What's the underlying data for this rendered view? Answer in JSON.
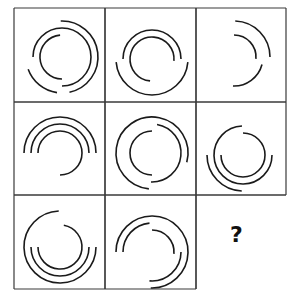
{
  "puzzle": {
    "type": "matrix-reasoning",
    "rows": 3,
    "cols": 3,
    "grid_x": [
      14,
      105,
      196,
      286
    ],
    "grid_y": [
      8,
      102,
      195,
      289
    ],
    "line_color": "#3a3a3a",
    "stroke_color": "#1a1a1a",
    "missing_cell": {
      "row": 2,
      "col": 2,
      "label": "?"
    },
    "cells": [
      {
        "row": 0,
        "col": 0,
        "center": [
          48,
          49
        ],
        "arcs": [
          {
            "r": 22,
            "start": 90,
            "end": 265
          },
          {
            "r": 29,
            "start": 180,
            "end": 450
          },
          {
            "r": 36,
            "start": -92,
            "end": 78
          },
          {
            "r": 36,
            "start": 98,
            "end": 160
          }
        ]
      },
      {
        "row": 0,
        "col": 1,
        "center": [
          47,
          51
        ],
        "arcs": [
          {
            "r": 22,
            "start": 95,
            "end": 365
          },
          {
            "r": 29,
            "start": 180,
            "end": 360
          },
          {
            "r": 36,
            "start": 5,
            "end": 175
          }
        ]
      },
      {
        "row": 0,
        "col": 2,
        "center": [
          38,
          49
        ],
        "arcs": [
          {
            "r": 22,
            "start": -90,
            "end": 5
          },
          {
            "r": 29,
            "start": 15,
            "end": 92
          },
          {
            "r": 36,
            "start": -88,
            "end": 0
          }
        ]
      },
      {
        "row": 1,
        "col": 0,
        "center": [
          46,
          51
        ],
        "arcs": [
          {
            "r": 22,
            "start": 180,
            "end": 450
          },
          {
            "r": 29,
            "start": 180,
            "end": 360
          },
          {
            "r": 36,
            "start": 180,
            "end": 360
          }
        ]
      },
      {
        "row": 1,
        "col": 1,
        "center": [
          47,
          51
        ],
        "arcs": [
          {
            "r": 22,
            "start": 90,
            "end": 270
          },
          {
            "r": 29,
            "start": -80,
            "end": 92
          },
          {
            "r": 36,
            "start": 95,
            "end": 375
          }
        ]
      },
      {
        "row": 1,
        "col": 2,
        "center": [
          47,
          53
        ],
        "arcs": [
          {
            "r": 22,
            "start": -90,
            "end": 180
          },
          {
            "r": 29,
            "start": 0,
            "end": 268
          },
          {
            "r": 36,
            "start": 92,
            "end": 180
          }
        ]
      },
      {
        "row": 2,
        "col": 0,
        "center": [
          46,
          52
        ],
        "arcs": [
          {
            "r": 22,
            "start": -80,
            "end": 180
          },
          {
            "r": 29,
            "start": 0,
            "end": 180
          },
          {
            "r": 36,
            "start": 0,
            "end": 268
          }
        ]
      },
      {
        "row": 2,
        "col": 1,
        "center": [
          47,
          57
        ],
        "arcs": [
          {
            "r": 22,
            "start": -90,
            "end": 5
          },
          {
            "r": 29,
            "start": 180,
            "end": 265
          },
          {
            "r": 29,
            "start": 0,
            "end": 95
          },
          {
            "r": 36,
            "start": 180,
            "end": 452
          }
        ]
      }
    ]
  }
}
